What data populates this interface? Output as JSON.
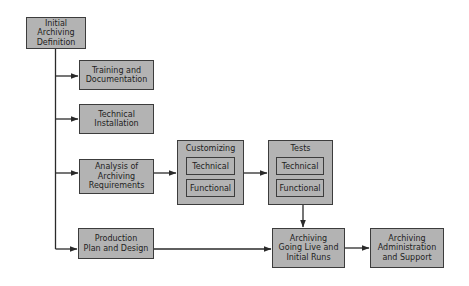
{
  "diagram": {
    "type": "flowchart",
    "colors": {
      "box_fill": "#b3b3b3",
      "border": "#3c3c3c",
      "line": "#2a2a2a",
      "background": "#ffffff"
    },
    "nodes": {
      "initial": {
        "label": "Initial\nArchiving\nDefinition"
      },
      "training": {
        "label": "Training and\nDocumentation"
      },
      "tech_install": {
        "label": "Technical\nInstallation"
      },
      "analysis": {
        "label": "Analysis of\nArchiving\nRequirements"
      },
      "customizing": {
        "title": "Customizing",
        "items": [
          "Technical",
          "Functional"
        ]
      },
      "tests": {
        "title": "Tests",
        "items": [
          "Technical",
          "Functional"
        ]
      },
      "production": {
        "label": "Production\nPlan and Design"
      },
      "going_live": {
        "label": "Archiving\nGoing Live and\nInitial Runs"
      },
      "admin": {
        "label": "Archiving\nAdministration\nand Support"
      }
    },
    "edges": [
      [
        "Initial Archiving Definition",
        "Training and Documentation"
      ],
      [
        "Initial Archiving Definition",
        "Technical Installation"
      ],
      [
        "Initial Archiving Definition",
        "Analysis of Archiving Requirements"
      ],
      [
        "Initial Archiving Definition",
        "Production Plan and Design"
      ],
      [
        "Analysis of Archiving Requirements",
        "Customizing"
      ],
      [
        "Customizing",
        "Tests"
      ],
      [
        "Tests",
        "Archiving Going Live and Initial Runs"
      ],
      [
        "Production Plan and Design",
        "Archiving Going Live and Initial Runs"
      ],
      [
        "Archiving Going Live and Initial Runs",
        "Archiving Administration and Support"
      ]
    ]
  }
}
